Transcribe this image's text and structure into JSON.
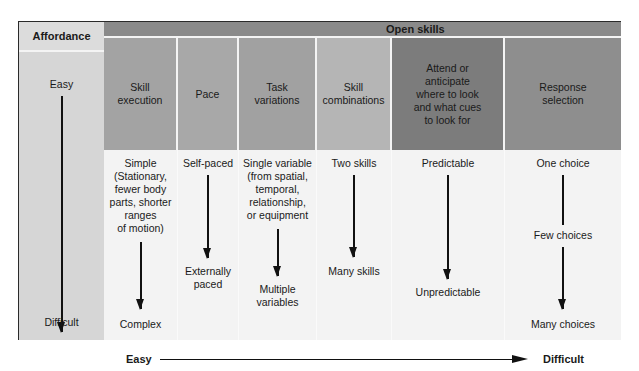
{
  "affordance": {
    "header": "Affordance",
    "top_label": "Easy",
    "bottom_label": "Difficult"
  },
  "open_skills": {
    "header": "Open skills",
    "columns": [
      {
        "header": "Skill\nexecution",
        "top": "Simple\n(Stationary,\nfewer body\nparts, shorter\nranges\nof motion)",
        "mid": "",
        "bottom": "Complex",
        "color": "#a3a3a3"
      },
      {
        "header": "Pace",
        "top": "Self-paced",
        "mid": "",
        "bottom": "Externally\npaced",
        "color": "#a8a8a8"
      },
      {
        "header": "Task\nvariations",
        "top": "Single variable\n(from spatial,\ntemporal,\nrelationship,\nor equipment",
        "mid": "",
        "bottom": "Multiple\nvariables",
        "color": "#a1a1a1"
      },
      {
        "header": "Skill\ncombinations",
        "top": "Two skills",
        "mid": "",
        "bottom": "Many skills",
        "color": "#b5b5b5"
      },
      {
        "header": "Attend or\nanticipate\nwhere to look\nand what cues\nto look for",
        "top": "Predictable",
        "mid": "",
        "bottom": "Unpredictable",
        "color": "#7c7c7c"
      },
      {
        "header": "Response\nselection",
        "top": "One choice",
        "mid": "Few choices",
        "bottom": "Many choices",
        "color": "#8e8e8e"
      }
    ]
  },
  "axis": {
    "left_label": "Easy",
    "right_label": "Difficult"
  }
}
